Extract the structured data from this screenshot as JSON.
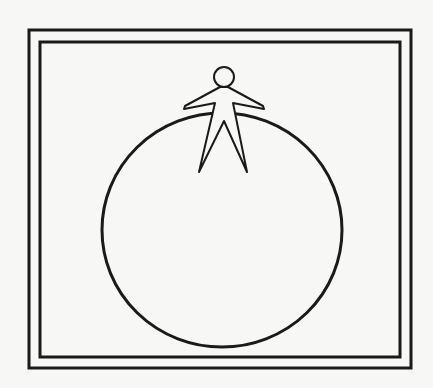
{
  "figure": {
    "stroke_color": "#1a1a1a",
    "background_color": "#f7f7f5",
    "elements": {
      "outer_frame": {
        "x": 29,
        "y": 29,
        "width": 382,
        "height": 339
      },
      "inner_frame": {
        "x": 40,
        "y": 41,
        "width": 360,
        "height": 317
      },
      "circle": {
        "cx": 222,
        "cy": 230,
        "rx": 120,
        "ry": 117
      },
      "person": {
        "head_cx": 224,
        "head_cy": 77,
        "head_r": 10
      }
    }
  }
}
